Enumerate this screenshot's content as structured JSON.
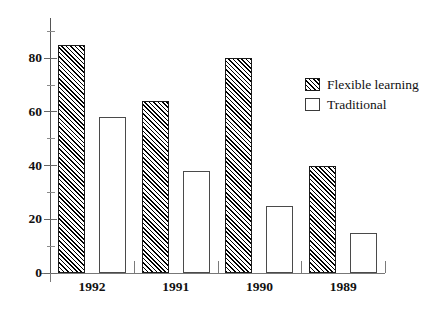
{
  "chart_data": {
    "type": "bar",
    "title": "",
    "xlabel": "",
    "ylabel": "",
    "categories": [
      "1992",
      "1991",
      "1990",
      "1989"
    ],
    "series": [
      {
        "name": "Flexible learning",
        "values": [
          85,
          64,
          80,
          40
        ],
        "style": "hatched"
      },
      {
        "name": "Traditional",
        "values": [
          58,
          38,
          25,
          15
        ],
        "style": "plain"
      }
    ],
    "ylim": [
      0,
      95
    ],
    "y_major_ticks": [
      0,
      20,
      40,
      60,
      80
    ],
    "y_minor_ticks": [
      10,
      30,
      50,
      70,
      90
    ],
    "y_tick_labels": [
      "0",
      "20",
      "40",
      "60",
      "80"
    ],
    "grid": false,
    "legend_position": "upper right",
    "colors": {
      "bar_outline": "#1a1a1a",
      "bar_fill": "#ffffff",
      "hatch": "#000000",
      "axis": "#555555",
      "text": "#111111"
    }
  },
  "legend": {
    "items": [
      {
        "label": "Flexible learning",
        "swatch": "hatched-swatch-icon"
      },
      {
        "label": "Traditional",
        "swatch": "plain-swatch-icon"
      }
    ]
  }
}
